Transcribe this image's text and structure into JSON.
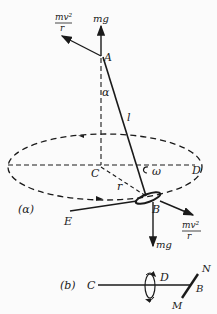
{
  "figure_a": {
    "panel_label": "(α)",
    "labels": {
      "A": "A",
      "C": "C",
      "D": "D",
      "B": "B",
      "E": "E",
      "r": "r",
      "l": "l",
      "alpha": "α",
      "omega": "ω",
      "mg_top": "mg",
      "mg_bottom": "mg",
      "force_top_num": "mv²",
      "force_top_den": "r",
      "force_bottom_num": "mv²",
      "force_bottom_den": "r"
    }
  },
  "figure_b": {
    "panel_label": "(b)",
    "labels": {
      "C": "C",
      "D": "D",
      "B": "B",
      "N": "N",
      "M": "M"
    }
  },
  "colors": {
    "ink": "#1a1a1a",
    "background": "#fbfbfb"
  }
}
